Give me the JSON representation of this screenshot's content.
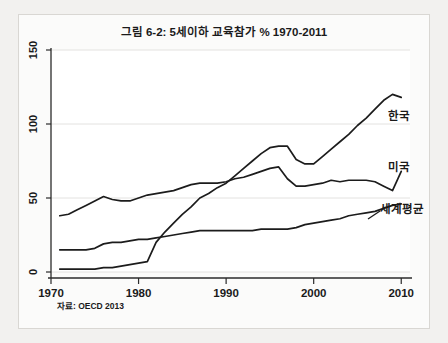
{
  "figure": {
    "title": "그림 6-2: 5세이하 교육참가 % 1970-2011",
    "source_note": "자료: OECD 2013",
    "background_color": "#f2f1ef",
    "panel_color": "#fbfbfa",
    "line_color": "#1c1c1c",
    "grid_color": "#e3e2e0"
  },
  "chart_data": {
    "type": "line",
    "title": "그림 6-2: 5세이하 교육참가 % 1970-2011",
    "subtitle": "",
    "xlabel": "",
    "ylabel": "",
    "xlim": [
      1970,
      2011
    ],
    "ylim": [
      0,
      150
    ],
    "xticks": [
      1970,
      1980,
      1990,
      2000,
      2010
    ],
    "yticks": [
      0,
      50,
      100,
      150
    ],
    "xtick_labels": [
      "1970",
      "1980",
      "1990",
      "2000",
      "2010"
    ],
    "ytick_labels": [
      "0",
      "50",
      "100",
      "150"
    ],
    "grid": true,
    "legend_position": "inline-right-end-labels",
    "annotations": [
      "자료: OECD 2013"
    ],
    "x": [
      1971,
      1972,
      1973,
      1974,
      1975,
      1976,
      1977,
      1978,
      1979,
      1980,
      1981,
      1982,
      1983,
      1984,
      1985,
      1986,
      1987,
      1988,
      1989,
      1990,
      1991,
      1992,
      1993,
      1994,
      1995,
      1996,
      1997,
      1998,
      1999,
      2000,
      2001,
      2002,
      2003,
      2004,
      2005,
      2006,
      2007,
      2008,
      2009,
      2010
    ],
    "series": [
      {
        "name": "한국",
        "label": "한국",
        "values": [
          2,
          2,
          2,
          2,
          2,
          3,
          3,
          4,
          5,
          6,
          7,
          20,
          27,
          33,
          39,
          44,
          50,
          53,
          57,
          60,
          65,
          70,
          75,
          80,
          84,
          85,
          85,
          76,
          73,
          73,
          78,
          83,
          88,
          93,
          99,
          104,
          110,
          116,
          120,
          118
        ]
      },
      {
        "name": "미국",
        "label": "미국",
        "values": [
          38,
          39,
          42,
          45,
          48,
          51,
          49,
          48,
          48,
          50,
          52,
          53,
          54,
          55,
          57,
          59,
          60,
          60,
          60,
          61,
          63,
          64,
          66,
          68,
          70,
          71,
          63,
          58,
          58,
          59,
          60,
          62,
          61,
          62,
          62,
          62,
          61,
          58,
          55,
          68
        ]
      },
      {
        "name": "세계평균",
        "label": "세계평균",
        "values": [
          15,
          15,
          15,
          15,
          16,
          19,
          20,
          20,
          21,
          22,
          22,
          23,
          24,
          25,
          26,
          27,
          28,
          28,
          28,
          28,
          28,
          28,
          28,
          29,
          29,
          29,
          29,
          30,
          32,
          33,
          34,
          35,
          36,
          38,
          39,
          40,
          41,
          43,
          45,
          46
        ]
      }
    ]
  },
  "series_labels": [
    {
      "text": "한국",
      "x_px": 388,
      "y_px": 120
    },
    {
      "text": "미국",
      "x_px": 388,
      "y_px": 171
    },
    {
      "text": "세계평균",
      "x_px": 380,
      "y_px": 213
    }
  ]
}
